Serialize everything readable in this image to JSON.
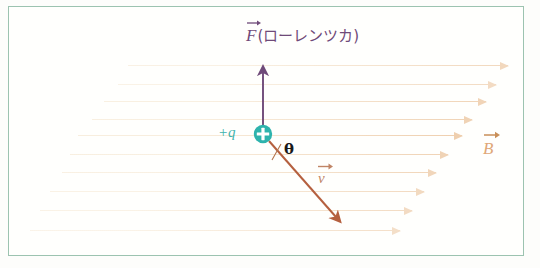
{
  "diagram": {
    "background_color": "#fdfdfb",
    "frame_color": "#9cc3b0"
  },
  "labels": {
    "force_symbol": "F",
    "force_caption": "(ローレンツカ)",
    "charge": "+q",
    "angle": "θ",
    "velocity_symbol": "v",
    "field_symbol": "B"
  },
  "colors": {
    "force": "#6f4a79",
    "charge": "#2eb3ad",
    "velocity": "#b5603f",
    "field": "#e8b98a",
    "field_line_light": "#f5e6cf",
    "angle": "#1a1a1a",
    "frame": "#9cc3b0"
  },
  "vectors": [
    {
      "name": "force",
      "symbol": "F",
      "direction": "up",
      "color": "#6f4a79",
      "origin": [
        263,
        134
      ],
      "tip": [
        263,
        66
      ]
    },
    {
      "name": "velocity",
      "symbol": "v",
      "direction": "down-right",
      "color": "#b5603f",
      "origin": [
        268,
        140
      ],
      "tip": [
        341,
        223
      ]
    },
    {
      "name": "magnetic_field",
      "symbol": "B",
      "direction": "right",
      "color": "#e8b98a"
    }
  ],
  "charge": {
    "sign": "+",
    "label": "+q",
    "center": [
      263,
      134
    ],
    "radius": 9,
    "color": "#2eb3ad"
  },
  "field_lines": [
    {
      "y": 65,
      "x1": 128,
      "x2": 508,
      "opacity": 0.55
    },
    {
      "y": 84,
      "x1": 118,
      "x2": 496,
      "opacity": 0.5
    },
    {
      "y": 101,
      "x1": 104,
      "x2": 486,
      "opacity": 0.6
    },
    {
      "y": 119,
      "x1": 92,
      "x2": 472,
      "opacity": 0.62
    },
    {
      "y": 135,
      "x1": 78,
      "x2": 462,
      "opacity": 0.68
    },
    {
      "y": 154,
      "x1": 70,
      "x2": 448,
      "opacity": 0.62
    },
    {
      "y": 172,
      "x1": 62,
      "x2": 436,
      "opacity": 0.58
    },
    {
      "y": 191,
      "x1": 50,
      "x2": 424,
      "opacity": 0.52
    },
    {
      "y": 210,
      "x1": 40,
      "x2": 412,
      "opacity": 0.5
    },
    {
      "y": 230,
      "x1": 30,
      "x2": 400,
      "opacity": 0.45
    }
  ]
}
